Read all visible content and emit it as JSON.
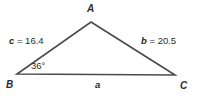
{
  "figure": {
    "type": "triangle-diagram",
    "stroke_color": "#4a4a4a",
    "text_color": "#2b2b2b",
    "background_color": "#ffffff"
  },
  "vertices": {
    "A": {
      "label": "A",
      "x": 91,
      "y": 22
    },
    "B": {
      "label": "B",
      "x": 17,
      "y": 74
    },
    "C": {
      "label": "C",
      "x": 175,
      "y": 75
    }
  },
  "sides": {
    "c": {
      "var": "c",
      "equals": "= 16.4",
      "full": "c = 16.4",
      "value": 16.4,
      "between": "B-A"
    },
    "b": {
      "var": "b",
      "equals": "= 20.5",
      "full": "b = 20.5",
      "value": 20.5,
      "between": "A-C"
    },
    "a": {
      "var": "a",
      "equals": "",
      "full": "a",
      "value": null,
      "between": "B-C"
    }
  },
  "angles": {
    "B": {
      "label": "36°",
      "value": 36,
      "unit": "degrees",
      "at_vertex": "B"
    }
  }
}
